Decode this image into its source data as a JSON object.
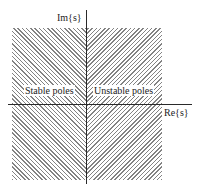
{
  "diagram": {
    "axes": {
      "imaginary_label": "Im{s}",
      "real_label": "Re{s}"
    },
    "regions": [
      {
        "name": "left-half-plane",
        "label": "Stable poles",
        "hatch": "forward-diagonal"
      },
      {
        "name": "right-half-plane",
        "label": "Unstable poles",
        "hatch": "backward-diagonal"
      }
    ],
    "colors": {
      "hatch": "#6d6d6d",
      "axis": "#2a2a2a",
      "background": "#ffffff"
    }
  }
}
